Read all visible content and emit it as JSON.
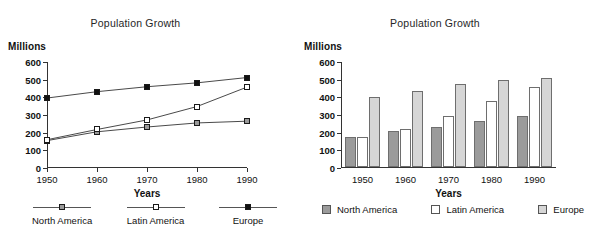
{
  "figure": {
    "panels": [
      {
        "id": "line-panel",
        "title": "Population Growth",
        "y_unit_label": "Millions",
        "x_axis_title": "Years"
      },
      {
        "id": "bar-panel",
        "title": "Population Growth",
        "y_unit_label": "Millions",
        "x_axis_title": "Years"
      }
    ]
  },
  "legend_left": {
    "items": [
      {
        "label": "North America",
        "marker": "gray-square-marker",
        "color": "#9a9a9a"
      },
      {
        "label": "Latin America",
        "marker": "white-square-marker",
        "color": "#ffffff"
      },
      {
        "label": "Europe",
        "marker": "black-square-marker",
        "color": "#111111"
      }
    ]
  },
  "legend_right": {
    "items": [
      {
        "label": "North America",
        "swatch": "gray-swatch",
        "color": "#9b9b9b"
      },
      {
        "label": "Latin America",
        "swatch": "white-swatch",
        "color": "#ffffff"
      },
      {
        "label": "Europe",
        "swatch": "light-gray-swatch",
        "color": "#d6d6d6"
      }
    ]
  },
  "chart_data": [
    {
      "type": "line",
      "title": "Population Growth",
      "xlabel": "Years",
      "ylabel": "Millions",
      "categories": [
        "1950",
        "1960",
        "1970",
        "1980",
        "1990"
      ],
      "x": [
        1950,
        1960,
        1970,
        1980,
        1990
      ],
      "xlim": [
        1950,
        1990
      ],
      "ylim": [
        0,
        600
      ],
      "yticks": [
        0,
        100,
        200,
        300,
        400,
        500,
        600
      ],
      "ytick_labels": [
        "0",
        "100",
        "200",
        "300",
        "400",
        "500",
        "600"
      ],
      "grid": false,
      "legend_position": "bottom",
      "series": [
        {
          "name": "North America",
          "values": [
            155,
            205,
            232,
            255,
            265
          ],
          "marker": "square",
          "color": "#9a9a9a"
        },
        {
          "name": "Latin America",
          "values": [
            160,
            218,
            272,
            348,
            458
          ],
          "marker": "square",
          "color": "#ffffff"
        },
        {
          "name": "Europe",
          "values": [
            396,
            432,
            460,
            482,
            512
          ],
          "marker": "square",
          "color": "#111111"
        }
      ]
    },
    {
      "type": "bar",
      "title": "Population Growth",
      "xlabel": "Years",
      "ylabel": "Millions",
      "categories": [
        "1950",
        "1960",
        "1970",
        "1980",
        "1990"
      ],
      "ylim": [
        0,
        600
      ],
      "yticks": [
        0,
        100,
        200,
        300,
        400,
        500,
        600
      ],
      "ytick_labels": [
        "0",
        "100",
        "200",
        "300",
        "400",
        "500",
        "600"
      ],
      "grid": false,
      "legend_position": "bottom",
      "series": [
        {
          "name": "North America",
          "values": [
            170,
            203,
            228,
            258,
            290
          ],
          "color": "#9b9b9b"
        },
        {
          "name": "Latin America",
          "values": [
            170,
            218,
            288,
            372,
            452
          ],
          "color": "#ffffff"
        },
        {
          "name": "Europe",
          "values": [
            395,
            428,
            468,
            492,
            505
          ],
          "color": "#d6d6d6"
        }
      ]
    }
  ]
}
